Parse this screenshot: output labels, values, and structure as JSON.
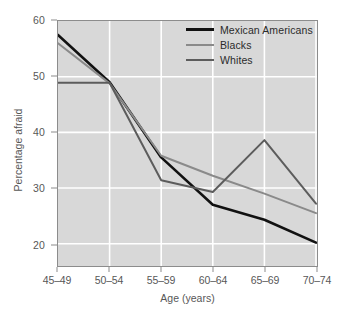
{
  "chart_data": {
    "type": "line",
    "title": "",
    "xlabel": "Age (years)",
    "ylabel": "Percentage afraid",
    "categories": [
      "45–49",
      "50–54",
      "55–59",
      "60–64",
      "65–69",
      "70–74"
    ],
    "ylim": [
      16,
      60
    ],
    "yticks": [
      20,
      30,
      40,
      50,
      60
    ],
    "ytick_labels": [
      "20",
      "30",
      "40",
      "50",
      "60"
    ],
    "grid": true,
    "grid_color": "#ffffff",
    "plot_background": "#d8d8d8",
    "legend_position": "top-right",
    "series": [
      {
        "name": "Mexican Americans",
        "color": "#111111",
        "width": 2.6,
        "values": [
          57.5,
          49.0,
          35.5,
          27.0,
          24.3,
          20.2
        ]
      },
      {
        "name": "Blacks",
        "color": "#8a8a8a",
        "width": 2.0,
        "values": [
          56.0,
          48.8,
          35.8,
          32.2,
          29.0,
          25.5
        ]
      },
      {
        "name": "Whites",
        "color": "#5c5c5c",
        "width": 2.0,
        "values": [
          48.9,
          48.9,
          31.4,
          29.3,
          38.6,
          27.2
        ]
      }
    ]
  }
}
